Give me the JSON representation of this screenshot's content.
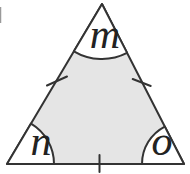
{
  "figure": {
    "angle_labels": {
      "top": "m",
      "bottom_left": "n",
      "bottom_right": "o"
    },
    "tick_marks_count": "3",
    "colors": {
      "interior_fill": "#e5e5e5",
      "corner_fill": "#ffffff",
      "line": "#333333",
      "background": "#ffffff"
    }
  }
}
